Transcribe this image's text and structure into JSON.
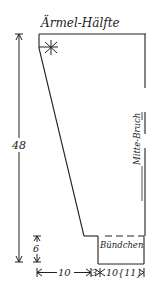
{
  "title": "Ärmel-Hälfte",
  "labels": {
    "height_total": "48",
    "cuff_height": "6",
    "fold_line": "Mitte-Bruch",
    "cuff": "Bündchen",
    "bottom_left": "10",
    "bottom_middle": "3",
    "bottom_right": "10{11}"
  },
  "marks": {
    "star": "asterisk-mark"
  },
  "colors": {
    "line": "#222222",
    "background": "#ffffff"
  }
}
